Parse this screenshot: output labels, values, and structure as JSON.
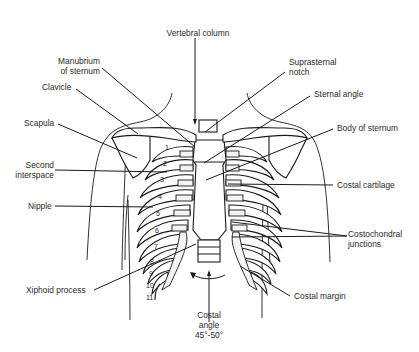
{
  "figure": {
    "type": "anatomical-diagram",
    "labels": {
      "vertebral_column": "Vertebral column",
      "manubrium_line1": "Manubrium",
      "manubrium_line2": "of sternum",
      "suprasternal_line1": "Suprasternal",
      "suprasternal_line2": "notch",
      "clavicle": "Clavicle",
      "sternal_angle": "Sternal angle",
      "scapula": "Scapula",
      "body_of_sternum": "Body of sternum",
      "second_interspace_line1": "Second",
      "second_interspace_line2": "interspace",
      "costal_cartilage": "Costal cartilage",
      "nipple": "Nipple",
      "costochondral_line1": "Costochondral",
      "costochondral_line2": "junctions",
      "xiphoid_process": "Xiphoid process",
      "costal_margin": "Costal margin",
      "costal_angle_line1": "Costal",
      "costal_angle_line2": "angle",
      "costal_angle_line3": "45°-50°"
    },
    "rib_numbers": [
      "1",
      "2",
      "3",
      "4",
      "5",
      "6",
      "7",
      "8",
      "9",
      "10",
      "11"
    ],
    "colors": {
      "line": "#1a1a1a",
      "text": "#2a2a2a",
      "background": "#ffffff"
    }
  }
}
